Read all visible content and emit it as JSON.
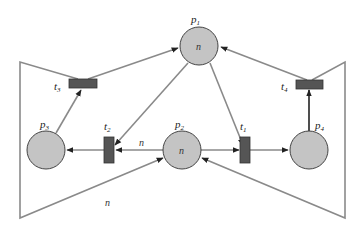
{
  "diagram": {
    "type": "petri-net",
    "colors": {
      "place_fill": "#c4c4c4",
      "place_stroke": "#444444",
      "transition_fill": "#555555",
      "arc": "#8a8a8a",
      "background": "#ffffff"
    },
    "places": [
      {
        "id": "p1",
        "label": "p",
        "sub": "1",
        "tokens": "n"
      },
      {
        "id": "p2",
        "label": "p",
        "sub": "2",
        "tokens": "n"
      },
      {
        "id": "p3",
        "label": "p",
        "sub": "3",
        "tokens": ""
      },
      {
        "id": "p4",
        "label": "p",
        "sub": "4",
        "tokens": ""
      }
    ],
    "transitions": [
      {
        "id": "t1",
        "label": "t",
        "sub": "1"
      },
      {
        "id": "t2",
        "label": "t",
        "sub": "2"
      },
      {
        "id": "t3",
        "label": "t",
        "sub": "3"
      },
      {
        "id": "t4",
        "label": "t",
        "sub": "4"
      }
    ],
    "arcs": [
      {
        "from": "p1",
        "to": "t1"
      },
      {
        "from": "p1",
        "to": "t2"
      },
      {
        "from": "p2",
        "to": "t1"
      },
      {
        "from": "p2",
        "to": "t2",
        "weight": "n"
      },
      {
        "from": "t1",
        "to": "p4"
      },
      {
        "from": "t2",
        "to": "p3"
      },
      {
        "from": "p3",
        "to": "t3"
      },
      {
        "from": "p4",
        "to": "t4"
      },
      {
        "from": "t3",
        "to": "p1"
      },
      {
        "from": "t4",
        "to": "p1"
      },
      {
        "from": "t3",
        "to": "p2",
        "weight": "n"
      },
      {
        "from": "t4",
        "to": "p2"
      }
    ],
    "arc_labels": {
      "p2_t2": "n",
      "t3_p2": "n"
    }
  }
}
